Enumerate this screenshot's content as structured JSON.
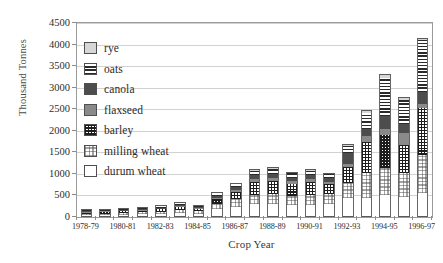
{
  "chart_data": {
    "type": "bar",
    "stacked": true,
    "title": "",
    "xlabel": "Crop Year",
    "ylabel": "Thousand Tonnes",
    "ylim": [
      0,
      4500
    ],
    "ytick_values": [
      0,
      500,
      1000,
      1500,
      2000,
      2500,
      3000,
      3500,
      4000,
      4500
    ],
    "ytick_labels": [
      "0",
      "500",
      "1000",
      "1500",
      "2000",
      "2500",
      "3000",
      "3500",
      "4000",
      "4500"
    ],
    "grid": "horizontal",
    "legend_position": "upper-left-inside",
    "categories": [
      "1978-79",
      "1979-80",
      "1980-81",
      "1981-82",
      "1982-83",
      "1983-84",
      "1984-85",
      "1985-86",
      "1986-87",
      "1987-88",
      "1988-89",
      "1989-90",
      "1990-91",
      "1991-92",
      "1992-93",
      "1993-94",
      "1994-95",
      "1995-96",
      "1996-97"
    ],
    "xtick_labels": [
      "1978-79",
      "1980-81",
      "1982-83",
      "1984-85",
      "1986-87",
      "1988-89",
      "1990-91",
      "1992-93",
      "1994-95",
      "1996-97"
    ],
    "xtick_label_indices": [
      0,
      2,
      4,
      6,
      8,
      10,
      12,
      14,
      16,
      18
    ],
    "series": [
      {
        "name": "durum wheat",
        "fill": "f-durum",
        "values": [
          40,
          45,
          55,
          60,
          70,
          95,
          75,
          175,
          230,
          300,
          300,
          270,
          290,
          300,
          450,
          450,
          500,
          460,
          560
        ]
      },
      {
        "name": "milling wheat",
        "fill": "f-milling",
        "values": [
          35,
          35,
          40,
          45,
          55,
          70,
          55,
          130,
          180,
          220,
          230,
          210,
          225,
          235,
          330,
          560,
          640,
          560,
          880
        ]
      },
      {
        "name": "barley",
        "fill": "f-barley",
        "values": [
          25,
          30,
          35,
          40,
          50,
          70,
          55,
          115,
          175,
          300,
          310,
          290,
          300,
          235,
          380,
          740,
          760,
          660,
          1080
        ]
      },
      {
        "name": "flaxseed",
        "fill": "f-flax",
        "values": [
          8,
          9,
          10,
          12,
          14,
          18,
          14,
          30,
          40,
          55,
          60,
          55,
          58,
          50,
          70,
          120,
          140,
          280,
          100
        ]
      },
      {
        "name": "canola",
        "fill": "f-canola",
        "values": [
          12,
          13,
          15,
          18,
          22,
          28,
          22,
          45,
          65,
          90,
          95,
          90,
          95,
          80,
          250,
          180,
          310,
          200,
          280
        ]
      },
      {
        "name": "oats",
        "fill": "f-oats",
        "values": [
          18,
          20,
          22,
          25,
          30,
          38,
          30,
          60,
          80,
          105,
          115,
          105,
          110,
          95,
          170,
          370,
          870,
          560,
          1200
        ]
      },
      {
        "name": "rye",
        "fill": "f-rye",
        "values": [
          7,
          8,
          8,
          10,
          12,
          15,
          12,
          22,
          30,
          35,
          40,
          35,
          38,
          30,
          50,
          70,
          110,
          60,
          50
        ]
      }
    ]
  },
  "legend": {
    "items": [
      {
        "label": "rye",
        "fill": "f-rye"
      },
      {
        "label": "oats",
        "fill": "f-oats"
      },
      {
        "label": "canola",
        "fill": "f-canola"
      },
      {
        "label": "flaxseed",
        "fill": "f-flax"
      },
      {
        "label": "barley",
        "fill": "f-barley"
      },
      {
        "label": "milling wheat",
        "fill": "f-milling"
      },
      {
        "label": "durum wheat",
        "fill": "f-durum"
      }
    ]
  },
  "colors": {
    "rye": "#d6d6d6",
    "canola": "#4d4d4d",
    "flaxseed": "#8a8a8a",
    "durum_wheat": "#ffffff",
    "grid": "#d2d2d2",
    "frame": "#9a9a9a",
    "text": "#2b2b2b"
  }
}
